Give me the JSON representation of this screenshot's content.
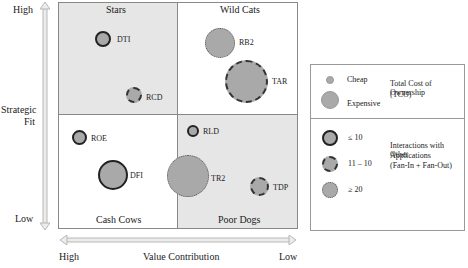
{
  "axes": {
    "y": {
      "title_line1": "Strategic",
      "title_line2": "Fit",
      "high": "High",
      "low": "Low"
    },
    "x": {
      "title": "Value Contribution",
      "high": "High",
      "low": "Low"
    }
  },
  "quadrants": {
    "top_left": "Stars",
    "top_right": "Wild Cats",
    "bottom_left": "Cash Cows",
    "bottom_right": "Poor Dogs"
  },
  "applications": [
    {
      "id": "DTI",
      "label": "DTI",
      "quadrant": "Stars",
      "size": "small-medium",
      "interactions": "≤ 10"
    },
    {
      "id": "RCD",
      "label": "RCD",
      "quadrant": "Stars",
      "size": "small",
      "interactions": "11 – 10"
    },
    {
      "id": "RB2",
      "label": "RB2",
      "quadrant": "Wild Cats",
      "size": "medium",
      "interactions": "≥ 20"
    },
    {
      "id": "TAR",
      "label": "TAR",
      "quadrant": "Wild Cats",
      "size": "large",
      "interactions": "11 – 10"
    },
    {
      "id": "ROE",
      "label": "ROE",
      "quadrant": "Cash Cows",
      "size": "small",
      "interactions": "≤ 10"
    },
    {
      "id": "DFI",
      "label": "DFI",
      "quadrant": "Cash Cows",
      "size": "medium-large",
      "interactions": "≤ 10"
    },
    {
      "id": "RLD",
      "label": "RLD",
      "quadrant": "Poor Dogs",
      "size": "small",
      "interactions": "≤ 10"
    },
    {
      "id": "TR2",
      "label": "TR2",
      "quadrant": "Poor Dogs",
      "size": "large",
      "interactions": "≥ 20"
    },
    {
      "id": "TDP",
      "label": "TDP",
      "quadrant": "Poor Dogs",
      "size": "small-medium",
      "interactions": "11 – 10"
    }
  ],
  "legend": {
    "tco": {
      "cheap": "Cheap",
      "expensive": "Expensive",
      "title_line1": "Total Cost of Ownership",
      "title_line2": "(TCO)"
    },
    "interactions": {
      "low": "≤ 10",
      "mid": "11 – 10",
      "high": "≥ 20",
      "title_line1": "Interactions with Other",
      "title_line2": "Applications",
      "title_line3": "(Fan-In + Fan-Out)"
    }
  },
  "colors": {
    "bubble_fill": "#a9a9a9",
    "quadrant_gray": "#e6e6e6",
    "border": "#888888"
  }
}
